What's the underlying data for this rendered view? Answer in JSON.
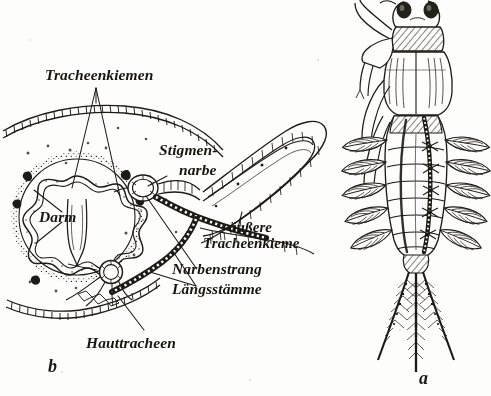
{
  "figure": {
    "kind": "scientific-illustration",
    "source_style": "scanned German textbook plate, pen-and-ink line drawing",
    "background_color": "#fdfdfb",
    "ink_color": "#1d1b16",
    "panels": [
      {
        "id": "a",
        "letter": "a",
        "caption_letter_position": "bottom-center-right",
        "description": "whole larva, dorsal view"
      },
      {
        "id": "b",
        "letter": "b",
        "caption_letter_position": "bottom-left",
        "description": "transverse section of the body"
      }
    ]
  },
  "labels": {
    "tracheenkiemen": "Tracheenkiemen",
    "stigmen_line1": "Stigmen-",
    "stigmen_line2": "narbe",
    "darm": "Darm",
    "aussere_line1": "äußere",
    "aussere_line2": "Tracheenkieme",
    "narbenstrang": "Narbenstrang",
    "laengsstaemme": "Längsstämme",
    "hauttracheen": "Hauttracheen"
  },
  "panel_letters": {
    "b": "b",
    "a": "a"
  }
}
